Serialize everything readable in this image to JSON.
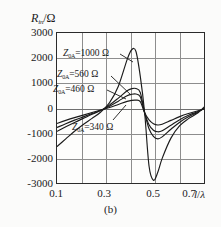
{
  "figure": {
    "caption": "(b)"
  },
  "chart_data": {
    "type": "line",
    "title": "",
    "subtitle": "",
    "caption": "(b)",
    "xlabel": "l/λ",
    "ylabel": "R₀ₐ/Ω",
    "ylabel_main": "R",
    "ylabel_sub": "in",
    "ylabel_unit": "/Ω",
    "xlim": [
      0.1,
      0.78
    ],
    "ylim": [
      -3000,
      3000
    ],
    "xticks": [
      0.1,
      0.3,
      0.5,
      0.7
    ],
    "xtick_labels": [
      "0.1",
      "0.3",
      "0.5",
      "0.7"
    ],
    "yticks": [
      -3000,
      -2000,
      -1000,
      0,
      1000,
      2000,
      3000
    ],
    "ytick_labels": [
      "-3000",
      "-2000",
      "-1000",
      "0",
      "1000",
      "2000",
      "3000"
    ],
    "x_minor_gridlines": [
      0.2,
      0.3,
      0.4,
      0.5,
      0.6,
      0.7
    ],
    "grid": true,
    "legend": "inline-annotations",
    "series": [
      {
        "name": "Z₀ₐ=1000 Ω",
        "label": "Z",
        "label_sub": "0A",
        "label_value": "=1000 Ω",
        "impedance": 1000,
        "unit": "Ω",
        "x": [
          0.1,
          0.14,
          0.18,
          0.22,
          0.26,
          0.3,
          0.34,
          0.38,
          0.42,
          0.44,
          0.46,
          0.48,
          0.5,
          0.52,
          0.54,
          0.56,
          0.58,
          0.62,
          0.66,
          0.7,
          0.74,
          0.78
        ],
        "y": [
          -1480,
          -1180,
          -880,
          -610,
          -370,
          -120,
          250,
          900,
          1950,
          2330,
          2280,
          1300,
          -150,
          -2250,
          -2810,
          -2500,
          -1950,
          -1150,
          -660,
          -380,
          -170,
          150
        ]
      },
      {
        "name": "Z₀ₐ=560 Ω",
        "label": "Z",
        "label_sub": "0A",
        "label_value": "=560 Ω",
        "impedance": 560,
        "unit": "Ω",
        "x": [
          0.1,
          0.14,
          0.18,
          0.22,
          0.26,
          0.3,
          0.34,
          0.38,
          0.42,
          0.44,
          0.46,
          0.48,
          0.5,
          0.52,
          0.54,
          0.56,
          0.58,
          0.62,
          0.66,
          0.7,
          0.74,
          0.78
        ],
        "y": [
          -880,
          -700,
          -530,
          -370,
          -210,
          -60,
          160,
          430,
          720,
          800,
          810,
          650,
          -150,
          -780,
          -1080,
          -1180,
          -1100,
          -800,
          -520,
          -310,
          -140,
          60
        ]
      },
      {
        "name": "Z₀ₐ=460 Ω",
        "label": "Z",
        "label_sub": "0A",
        "label_value": "=460 Ω",
        "impedance": 460,
        "unit": "Ω",
        "x": [
          0.1,
          0.14,
          0.18,
          0.22,
          0.26,
          0.3,
          0.34,
          0.38,
          0.42,
          0.44,
          0.46,
          0.48,
          0.5,
          0.52,
          0.54,
          0.56,
          0.58,
          0.62,
          0.66,
          0.7,
          0.74,
          0.78
        ],
        "y": [
          -730,
          -580,
          -440,
          -310,
          -180,
          -50,
          110,
          310,
          520,
          580,
          590,
          480,
          -150,
          -620,
          -840,
          -900,
          -860,
          -640,
          -420,
          -250,
          -110,
          50
        ]
      },
      {
        "name": "Z₀ₐ=340 Ω",
        "label": "Z",
        "label_sub": "0A",
        "label_value": "=340 Ω",
        "impedance": 340,
        "unit": "Ω",
        "x": [
          0.1,
          0.14,
          0.18,
          0.22,
          0.26,
          0.3,
          0.34,
          0.38,
          0.42,
          0.44,
          0.46,
          0.48,
          0.5,
          0.52,
          0.54,
          0.56,
          0.58,
          0.62,
          0.66,
          0.7,
          0.74,
          0.78
        ],
        "y": [
          -570,
          -450,
          -340,
          -240,
          -140,
          -40,
          60,
          180,
          300,
          340,
          350,
          290,
          -150,
          -430,
          -580,
          -630,
          -600,
          -450,
          -300,
          -180,
          -80,
          40
        ]
      }
    ]
  }
}
